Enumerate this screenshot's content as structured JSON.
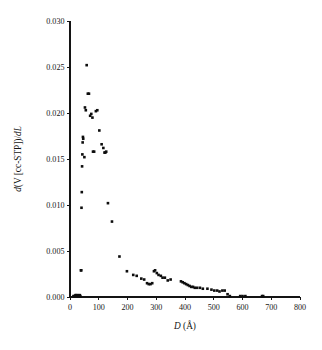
{
  "chart_data": {
    "type": "scatter",
    "title": "",
    "subtitle": "",
    "xlabel": "D (Å)",
    "xlabel_italic_part": "D",
    "xlabel_rest": " (Å)",
    "ylabel": "d(V [cc-STP])/dL",
    "ylabel_parts": [
      "d",
      "(V [cc-STP])/",
      "dL"
    ],
    "xlim": [
      0,
      800
    ],
    "ylim": [
      0.0,
      0.03
    ],
    "xticks": [
      0,
      100,
      200,
      300,
      400,
      500,
      600,
      700,
      800
    ],
    "xtick_labels": [
      "0",
      "100",
      "200",
      "300",
      "400",
      "500",
      "600",
      "700",
      "800"
    ],
    "yticks": [
      0.0,
      0.005,
      0.01,
      0.015,
      0.02,
      0.025,
      0.03
    ],
    "ytick_labels": [
      "0.000",
      "0.005",
      "0.010",
      "0.015",
      "0.020",
      "0.025",
      "0.030"
    ],
    "grid": false,
    "legend": false,
    "marker": "filled-square",
    "marker_color": "#0d0d0d",
    "marker_size_px": 2.6,
    "series": [
      {
        "name": "pore size distribution",
        "points": [
          [
            12,
            0.0001
          ],
          [
            16,
            0.0001
          ],
          [
            19,
            0.0002
          ],
          [
            22,
            0.0002
          ],
          [
            25,
            0.0001
          ],
          [
            28,
            0.0002
          ],
          [
            31,
            0.0001
          ],
          [
            34,
            0.0002
          ],
          [
            36,
            0.0001
          ],
          [
            38,
            0.0029
          ],
          [
            39,
            0.0029
          ],
          [
            40,
            0.0097
          ],
          [
            41,
            0.0114
          ],
          [
            42,
            0.0142
          ],
          [
            43,
            0.0155
          ],
          [
            44,
            0.0168
          ],
          [
            45,
            0.0174
          ],
          [
            46,
            0.0172
          ],
          [
            50,
            0.0152
          ],
          [
            52,
            0.0206
          ],
          [
            55,
            0.0203
          ],
          [
            58,
            0.0252
          ],
          [
            62,
            0.0221
          ],
          [
            66,
            0.0221
          ],
          [
            70,
            0.0197
          ],
          [
            74,
            0.0199
          ],
          [
            78,
            0.0195
          ],
          [
            80,
            0.0158
          ],
          [
            84,
            0.0158
          ],
          [
            90,
            0.0202
          ],
          [
            95,
            0.0203
          ],
          [
            102,
            0.0181
          ],
          [
            110,
            0.0166
          ],
          [
            116,
            0.0162
          ],
          [
            120,
            0.0157
          ],
          [
            123,
            0.0157
          ],
          [
            126,
            0.0158
          ],
          [
            132,
            0.0102
          ],
          [
            146,
            0.0082
          ],
          [
            172,
            0.0044
          ],
          [
            198,
            0.0028
          ],
          [
            220,
            0.0024
          ],
          [
            232,
            0.0023
          ],
          [
            248,
            0.002
          ],
          [
            258,
            0.0019
          ],
          [
            268,
            0.0015
          ],
          [
            274,
            0.0014
          ],
          [
            280,
            0.0014
          ],
          [
            286,
            0.0015
          ],
          [
            292,
            0.0028
          ],
          [
            296,
            0.0029
          ],
          [
            302,
            0.0026
          ],
          [
            308,
            0.0024
          ],
          [
            316,
            0.0023
          ],
          [
            322,
            0.0021
          ],
          [
            330,
            0.0021
          ],
          [
            340,
            0.0018
          ],
          [
            350,
            0.0019
          ],
          [
            386,
            0.0017
          ],
          [
            392,
            0.0016
          ],
          [
            398,
            0.0015
          ],
          [
            404,
            0.0014
          ],
          [
            410,
            0.0013
          ],
          [
            416,
            0.0012
          ],
          [
            422,
            0.0011
          ],
          [
            428,
            0.0011
          ],
          [
            434,
            0.001
          ],
          [
            442,
            0.001
          ],
          [
            452,
            0.001
          ],
          [
            462,
            0.0009
          ],
          [
            478,
            0.0009
          ],
          [
            492,
            0.0008
          ],
          [
            502,
            0.0007
          ],
          [
            512,
            0.0007
          ],
          [
            520,
            0.0006
          ],
          [
            530,
            0.0007
          ],
          [
            538,
            0.0007
          ],
          [
            548,
            0.0003
          ],
          [
            556,
            0.0001
          ],
          [
            592,
            0.0001
          ],
          [
            600,
            0.0001
          ],
          [
            610,
            0.0001
          ],
          [
            668,
            0.0001
          ],
          [
            672,
            0.0001
          ]
        ]
      }
    ]
  }
}
